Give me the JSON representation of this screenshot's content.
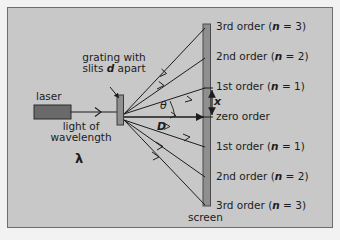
{
  "figure": {
    "background_color": "#c8c8c8",
    "frame_color": "#6e6e6e",
    "line_color": "#1c1c1c",
    "element_fill": "#8f8f8f",
    "laser_fill": "#6a6a6a"
  },
  "source": {
    "laser_label": "laser",
    "beam_line1": "light of",
    "beam_line2": "wavelength",
    "beam_symbol": "λ"
  },
  "grating": {
    "label_line1": "grating with",
    "label_line2_pre": "slits ",
    "label_line2_sym": "d",
    "label_line2_post": " apart"
  },
  "geometry": {
    "angle_symbol": "θ",
    "distance_symbol": "D",
    "fringe_spacing_symbol": "x"
  },
  "screen": {
    "label": "screen"
  },
  "orders": [
    {
      "id": "up-3",
      "text": "3rd order",
      "n_label": "n",
      "n_value": "3",
      "y": 27
    },
    {
      "id": "up-2",
      "text": "2nd order",
      "n_label": "n",
      "n_value": "2",
      "y": 57
    },
    {
      "id": "up-1",
      "text": "1st order",
      "n_label": "n",
      "n_value": "1",
      "y": 87
    },
    {
      "id": "zero",
      "text": "zero order",
      "n_label": "",
      "n_value": "",
      "y": 117
    },
    {
      "id": "down-1",
      "text": "1st order",
      "n_label": "n",
      "n_value": "1",
      "y": 147
    },
    {
      "id": "down-2",
      "text": "2nd order",
      "n_label": "n",
      "n_value": "2",
      "y": 177
    },
    {
      "id": "down-3",
      "text": "3rd order",
      "n_label": "n",
      "n_value": "3",
      "y": 206
    }
  ]
}
